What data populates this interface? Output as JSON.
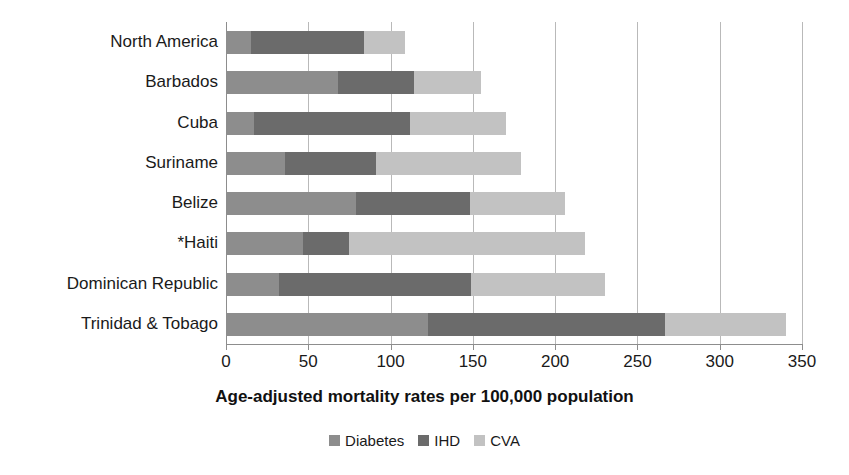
{
  "chart_data": {
    "type": "bar",
    "orientation": "horizontal",
    "stacked": true,
    "title": "",
    "xlabel": "Age-adjusted mortality rates per 100,000 population",
    "ylabel": "",
    "xlim": [
      0,
      350
    ],
    "xticks": [
      0,
      50,
      100,
      150,
      200,
      250,
      300,
      350
    ],
    "xtick_labels": [
      "0",
      "50",
      "100",
      "150",
      "200",
      "250",
      "300",
      "350"
    ],
    "grid": true,
    "grid_axis": "x",
    "legend_position": "bottom",
    "categories": [
      "North America",
      "Barbados",
      "Cuba",
      "Suriname",
      "Belize",
      "*Haiti",
      "Dominican Republic",
      "Trinidad & Tobago"
    ],
    "series": [
      {
        "name": "Diabetes",
        "color": "#8d8d8d",
        "values": [
          15,
          68,
          17,
          36,
          79,
          47,
          32,
          123
        ]
      },
      {
        "name": "IHD",
        "color": "#6b6b6b",
        "values": [
          69,
          46,
          95,
          55,
          69,
          28,
          117,
          144
        ]
      },
      {
        "name": "CVA",
        "color": "#c2c2c2",
        "values": [
          25,
          41,
          58,
          88,
          58,
          143,
          81,
          73
        ]
      }
    ],
    "totals": [
      109,
      155,
      170,
      179,
      206,
      218,
      230,
      340
    ],
    "legend": [
      {
        "label": "Diabetes",
        "color": "#8d8d8d"
      },
      {
        "label": "IHD",
        "color": "#6b6b6b"
      },
      {
        "label": "CVA",
        "color": "#c2c2c2"
      }
    ],
    "colors": {
      "diabetes": "#8d8d8d",
      "ihd": "#6b6b6b",
      "cva": "#c2c2c2",
      "gridline": "#b9b9b9",
      "axis": "#8d8d8d",
      "text": "#1a1a1a",
      "background": "#ffffff"
    }
  }
}
